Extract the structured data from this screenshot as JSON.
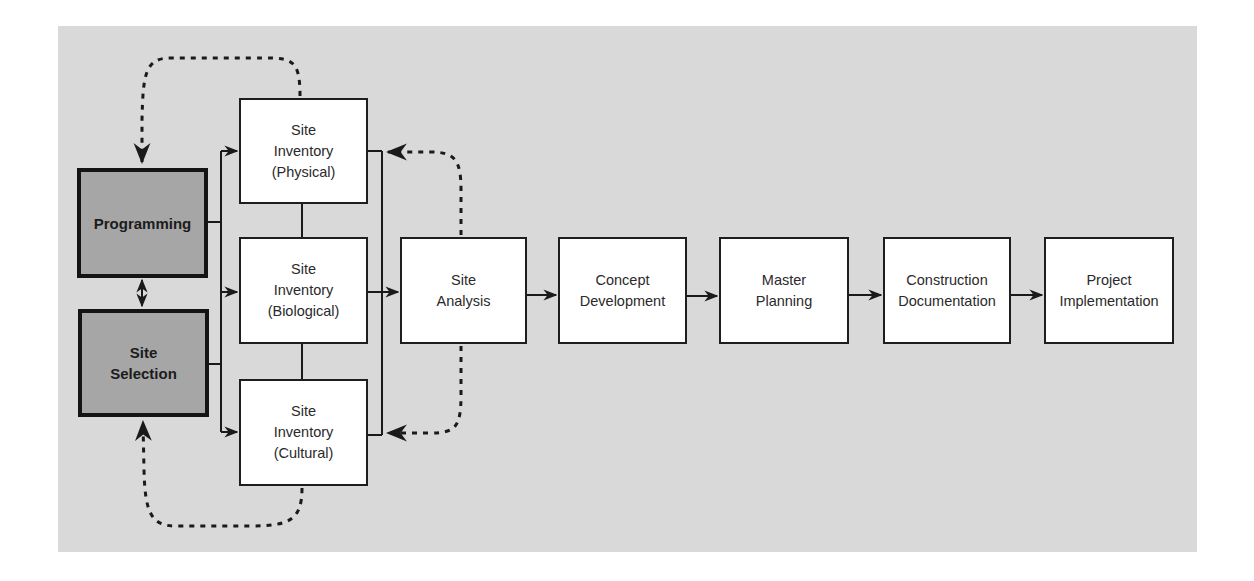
{
  "diagram": {
    "background_color": "#d9d9d9",
    "nodes": [
      {
        "id": "programming",
        "label": "Programming",
        "style": "dark"
      },
      {
        "id": "site-selection",
        "label": "Site\nSelection",
        "style": "dark"
      },
      {
        "id": "site-inventory-physical",
        "label": "Site\nInventory\n(Physical)",
        "style": "light"
      },
      {
        "id": "site-inventory-biological",
        "label": "Site\nInventory\n(Biological)",
        "style": "light"
      },
      {
        "id": "site-inventory-cultural",
        "label": "Site\nInventory\n(Cultural)",
        "style": "light"
      },
      {
        "id": "site-analysis",
        "label": "Site\nAnalysis",
        "style": "light"
      },
      {
        "id": "concept-development",
        "label": "Concept\nDevelopment",
        "style": "light"
      },
      {
        "id": "master-planning",
        "label": "Master\nPlanning",
        "style": "light"
      },
      {
        "id": "construction-documentation",
        "label": "Construction\nDocumentation",
        "style": "light"
      },
      {
        "id": "project-implementation",
        "label": "Project\nImplementation",
        "style": "light"
      }
    ],
    "edges": [
      {
        "from": "programming",
        "to": "site-selection",
        "type": "solid",
        "direction": "both"
      },
      {
        "from": "programming",
        "to": "site-inventory-physical",
        "type": "solid"
      },
      {
        "from": "programming",
        "to": "site-inventory-biological",
        "type": "solid"
      },
      {
        "from": "programming",
        "to": "site-inventory-cultural",
        "type": "solid"
      },
      {
        "from": "site-selection",
        "to": "site-inventory-physical",
        "type": "solid"
      },
      {
        "from": "site-selection",
        "to": "site-inventory-biological",
        "type": "solid"
      },
      {
        "from": "site-selection",
        "to": "site-inventory-cultural",
        "type": "solid"
      },
      {
        "from": "site-inventory-physical",
        "to": "site-inventory-biological",
        "type": "solid-line"
      },
      {
        "from": "site-inventory-biological",
        "to": "site-inventory-cultural",
        "type": "solid-line"
      },
      {
        "from": "site-inventory-physical",
        "to": "site-analysis",
        "type": "solid"
      },
      {
        "from": "site-inventory-biological",
        "to": "site-analysis",
        "type": "solid"
      },
      {
        "from": "site-inventory-cultural",
        "to": "site-analysis",
        "type": "solid"
      },
      {
        "from": "site-analysis",
        "to": "concept-development",
        "type": "solid"
      },
      {
        "from": "concept-development",
        "to": "master-planning",
        "type": "solid"
      },
      {
        "from": "master-planning",
        "to": "construction-documentation",
        "type": "solid"
      },
      {
        "from": "construction-documentation",
        "to": "project-implementation",
        "type": "solid"
      },
      {
        "from": "site-inventory-physical",
        "to": "programming",
        "type": "dotted"
      },
      {
        "from": "site-inventory-cultural",
        "to": "site-selection",
        "type": "dotted"
      },
      {
        "from": "site-analysis",
        "to": "site-inventory-physical",
        "type": "dotted"
      },
      {
        "from": "site-analysis",
        "to": "site-inventory-cultural",
        "type": "dotted"
      }
    ]
  }
}
